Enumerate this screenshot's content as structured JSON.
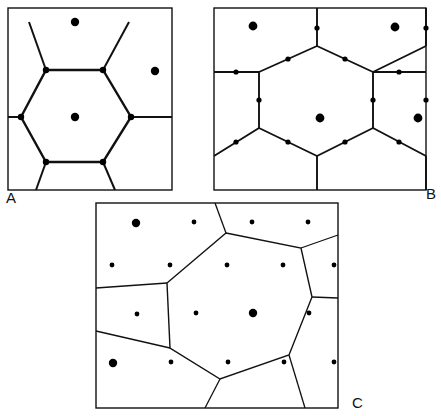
{
  "figure": {
    "width": 441,
    "height": 416,
    "background_color": "#ffffff",
    "line_color": "#111111",
    "dot_color": "#000000",
    "panels": [
      {
        "id": "A",
        "label": "A",
        "label_x": 6,
        "label_y": 203,
        "description": "Square panel with a single central hexagon cell, bond midpoint dots and lattice-site dots",
        "frame": {
          "x": 8,
          "y": 8,
          "width": 164,
          "height": 182
        },
        "pattern_type": "hexagonal-cell",
        "hexagon": {
          "center": [
            89,
            117
          ],
          "vertices": [
            [
              46,
              70
            ],
            [
              103,
              70
            ],
            [
              131,
              117
            ],
            [
              103,
              162
            ],
            [
              46,
              162
            ],
            [
              21,
              117
            ]
          ]
        },
        "stub_edges": [
          [
            [
              46,
              70
            ],
            [
              29,
              22
            ]
          ],
          [
            [
              103,
              70
            ],
            [
              129,
              22
            ]
          ],
          [
            [
              131,
              117
            ],
            [
              172,
              117
            ]
          ],
          [
            [
              103,
              162
            ],
            [
              115,
              190
            ]
          ],
          [
            [
              46,
              162
            ],
            [
              36,
              190
            ]
          ],
          [
            [
              21,
              117
            ],
            [
              8,
              117
            ]
          ]
        ],
        "vertex_dots": [
          [
            46,
            70
          ],
          [
            103,
            70
          ],
          [
            131,
            117
          ],
          [
            103,
            162
          ],
          [
            46,
            162
          ],
          [
            21,
            117
          ]
        ],
        "vertex_dot_radius": 3.2,
        "site_dots": [
          [
            75,
            22
          ],
          [
            155,
            71
          ],
          [
            75,
            117
          ]
        ],
        "site_dot_radius": 4.2
      },
      {
        "id": "B",
        "label": "B",
        "label_x": 426,
        "label_y": 199,
        "description": "Rectangular panel with a honeycomb lattice, vertex dots on bonds and large lattice-site dots",
        "frame": {
          "x": 214,
          "y": 8,
          "width": 212,
          "height": 182
        },
        "pattern_type": "honeycomb-lattice",
        "lattice_edges": [
          [
            [
              214,
              72
            ],
            [
              259,
              72
            ]
          ],
          [
            [
              259,
              72
            ],
            [
              317,
              46
            ]
          ],
          [
            [
              317,
              46
            ],
            [
              317,
              8
            ]
          ],
          [
            [
              317,
              46
            ],
            [
              373,
              72
            ]
          ],
          [
            [
              373,
              72
            ],
            [
              426,
              72
            ]
          ],
          [
            [
              373,
              72
            ],
            [
              426,
              46
            ]
          ],
          [
            [
              426,
              46
            ],
            [
              426,
              8
            ]
          ],
          [
            [
              259,
              72
            ],
            [
              259,
              128
            ]
          ],
          [
            [
              373,
              72
            ],
            [
              373,
              128
            ]
          ],
          [
            [
              214,
              156
            ],
            [
              259,
              128
            ]
          ],
          [
            [
              259,
              128
            ],
            [
              317,
              156
            ]
          ],
          [
            [
              317,
              156
            ],
            [
              373,
              128
            ]
          ],
          [
            [
              373,
              128
            ],
            [
              426,
              156
            ]
          ],
          [
            [
              317,
              156
            ],
            [
              317,
              190
            ]
          ],
          [
            [
              426,
              156
            ],
            [
              426,
              190
            ]
          ],
          [
            [
              259,
              128
            ],
            [
              259,
              128
            ]
          ]
        ],
        "bond_dots": [
          [
            236,
            72
          ],
          [
            288,
            59
          ],
          [
            317,
            28
          ],
          [
            345,
            59
          ],
          [
            399,
            72
          ],
          [
            259,
            100
          ],
          [
            373,
            100
          ],
          [
            236,
            142
          ],
          [
            288,
            142
          ],
          [
            345,
            142
          ],
          [
            399,
            142
          ],
          [
            426,
            100
          ],
          [
            426,
            28
          ]
        ],
        "bond_dot_radius": 2.6,
        "site_dots": [
          [
            253,
            26
          ],
          [
            395,
            27
          ],
          [
            320,
            118
          ],
          [
            418,
            118
          ]
        ],
        "site_dot_radius": 4.4
      },
      {
        "id": "C",
        "label": "C",
        "label_x": 352,
        "label_y": 408,
        "description": "Rectangular panel with an irregular Voronoi cell over a square grid of sites",
        "frame": {
          "x": 96,
          "y": 203,
          "width": 242,
          "height": 205
        },
        "pattern_type": "voronoi-cell",
        "voronoi_cell": [
          [
            226,
            233
          ],
          [
            301,
            248
          ],
          [
            312,
            297
          ],
          [
            289,
            355
          ],
          [
            220,
            379
          ],
          [
            170,
            348
          ],
          [
            167,
            283
          ]
        ],
        "voronoi_outer_edges": [
          [
            [
              226,
              233
            ],
            [
              215,
              203
            ]
          ],
          [
            [
              301,
              248
            ],
            [
              338,
              235
            ]
          ],
          [
            [
              312,
              297
            ],
            [
              338,
              298
            ]
          ],
          [
            [
              289,
              355
            ],
            [
              305,
              408
            ]
          ],
          [
            [
              220,
              379
            ],
            [
              205,
              408
            ]
          ],
          [
            [
              170,
              348
            ],
            [
              96,
              331
            ]
          ],
          [
            [
              167,
              283
            ],
            [
              96,
              288
            ]
          ]
        ],
        "grid_dots": [
          [
            136,
            223
          ],
          [
            194,
            222
          ],
          [
            252,
            222
          ],
          [
            308,
            222
          ],
          [
            112,
            265
          ],
          [
            170,
            265
          ],
          [
            227,
            265
          ],
          [
            283,
            265
          ],
          [
            334,
            265
          ],
          [
            137,
            314
          ],
          [
            196,
            313
          ],
          [
            253,
            313
          ],
          [
            309,
            313
          ],
          [
            113,
            363
          ],
          [
            171,
            362
          ],
          [
            228,
            362
          ],
          [
            284,
            362
          ],
          [
            334,
            362
          ]
        ],
        "grid_dot_radius": 2.4,
        "emphasized_dots": [
          [
            136,
            223
          ],
          [
            253,
            313
          ],
          [
            113,
            363
          ]
        ],
        "emphasized_dot_radius": 4.2
      }
    ]
  }
}
